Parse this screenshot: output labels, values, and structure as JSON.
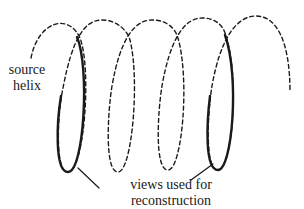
{
  "diagram": {
    "type": "helix-illustration",
    "labels": {
      "source_line1": "source",
      "source_line2": "helix",
      "views_line1": "views used for",
      "views_line2": "reconstruction"
    },
    "colors": {
      "line": "#1a1a1a",
      "background": "#ffffff"
    },
    "loops": 4,
    "highlighted_loops": [
      1,
      4
    ]
  }
}
